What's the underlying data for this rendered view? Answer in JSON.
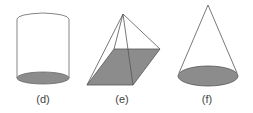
{
  "figures": [
    {
      "id": "d",
      "label": "(d)",
      "shape": "cylinder"
    },
    {
      "id": "e",
      "label": "(e)",
      "shape": "pyramid"
    },
    {
      "id": "f",
      "label": "(f)",
      "shape": "cone"
    }
  ],
  "colors": {
    "stroke": "#555555",
    "fill": "#8a8a8a"
  }
}
